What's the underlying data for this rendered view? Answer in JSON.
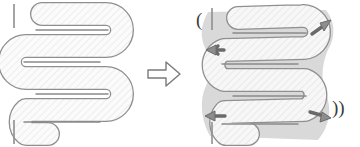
{
  "figure": {
    "title": "Serpentine tube deformation diagram",
    "background_color": "#ffffff",
    "panels": [
      {
        "id": "before",
        "label": "undeformed-serpentine-tube",
        "caption": "",
        "position": {
          "x": 8,
          "y": 6,
          "width": 120,
          "height": 135
        }
      },
      {
        "id": "after",
        "label": "deformed-serpentine-tube",
        "caption": "",
        "position": {
          "x": 196,
          "y": 6,
          "width": 140,
          "height": 135
        }
      }
    ],
    "transition_arrow": {
      "name": "rightwards-block-arrow",
      "glyph": "⇨",
      "direction": "right",
      "x": 146,
      "y": 58,
      "width": 34,
      "height": 30
    },
    "colors": {
      "tube_outline": "#8a8a8a",
      "tube_outline_dark": "#6f6f6f",
      "tube_fill": "#fafafa",
      "hatch_line": "#e2e2e2",
      "halo_shadow": "#cfcfcf",
      "arrow_marker_fill": "#8d8d8d",
      "arrow_marker_stroke": "#6a6a6a",
      "block_arrow_fill": "#ffffff",
      "block_arrow_stroke": "#777777",
      "motion_mark": "#3c3c3c",
      "background": "#ffffff"
    },
    "geometry": {
      "tube_width": 22,
      "pass_count": 4,
      "corner_radius": 11,
      "hatch_angle_deg": 45,
      "hatch_spacing": 5
    },
    "force_arrows": [
      {
        "name": "force-arrow-top-left",
        "x": 213,
        "y": 52,
        "angle": 200,
        "label": ""
      },
      {
        "name": "force-arrow-top-right",
        "x": 322,
        "y": 28,
        "angle": 335,
        "label": ""
      },
      {
        "name": "force-arrow-bottom-left",
        "x": 212,
        "y": 117,
        "angle": 195,
        "label": ""
      },
      {
        "name": "force-arrow-bottom-right",
        "x": 320,
        "y": 113,
        "angle": 350,
        "label": ""
      }
    ],
    "motion_marks": [
      {
        "name": "motion-mark-top-left",
        "glyph": "(",
        "x": 196,
        "y": 14
      },
      {
        "name": "motion-mark-bottom-right",
        "glyph": "))",
        "x": 333,
        "y": 100
      }
    ]
  }
}
